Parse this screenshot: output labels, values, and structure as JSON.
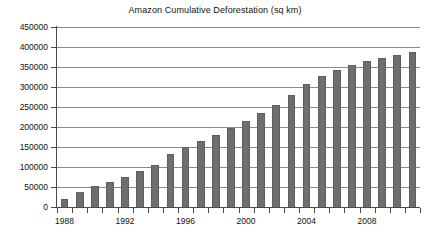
{
  "chart_data": {
    "type": "bar",
    "title": "Amazon Cumulative Deforestation (sq km)",
    "xlabel": "",
    "ylabel": "",
    "ylim": [
      0,
      450000
    ],
    "y_tick_step": 50000,
    "y_ticks": [
      0,
      50000,
      100000,
      150000,
      200000,
      250000,
      300000,
      350000,
      400000,
      450000
    ],
    "y_tick_labels": [
      "0",
      "50000",
      "100000",
      "150000",
      "200000",
      "250000",
      "300000",
      "350000",
      "400000",
      "450000"
    ],
    "grid": true,
    "legend": null,
    "x_tick_labels": [
      "1988",
      "1992",
      "1996",
      "2000",
      "2004",
      "2008"
    ],
    "x_tick_years": [
      1988,
      1992,
      1996,
      2000,
      2004,
      2008
    ],
    "xlim": [
      1987.5,
      2011.5
    ],
    "categories": [
      "1988",
      "1989",
      "1990",
      "1991",
      "1992",
      "1993",
      "1994",
      "1995",
      "1996",
      "1997",
      "1998",
      "1999",
      "2000",
      "2001",
      "2002",
      "2003",
      "2004",
      "2005",
      "2006",
      "2007",
      "2008",
      "2009",
      "2010",
      "2011"
    ],
    "values": [
      21050,
      38500,
      52000,
      63000,
      76000,
      90000,
      104000,
      133000,
      151000,
      164000,
      181000,
      198000,
      216000,
      234000,
      255000,
      280000,
      308000,
      327000,
      342000,
      354000,
      366000,
      373000,
      380000,
      388000
    ],
    "series": [
      {
        "name": "Cumulative Deforestation",
        "color": "#6e6e6e",
        "values": [
          21050,
          38500,
          52000,
          63000,
          76000,
          90000,
          104000,
          133000,
          151000,
          164000,
          181000,
          198000,
          216000,
          234000,
          255000,
          280000,
          308000,
          327000,
          342000,
          354000,
          366000,
          373000,
          380000,
          388000
        ]
      }
    ]
  },
  "style": {
    "bar_color": "#6e6e6e",
    "grid_color": "#8a8a8a",
    "axis_color": "#4a4a4a",
    "text_color": "#111111",
    "background": "#ffffff"
  }
}
